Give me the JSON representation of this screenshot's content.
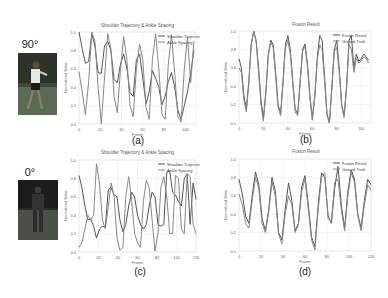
{
  "views": [
    {
      "angle_label": "90°",
      "photo": "person-walking-side-view"
    },
    {
      "angle_label": "0°",
      "photo": "person-walking-front-view"
    }
  ],
  "colors": {
    "series_a": "#555555",
    "series_b": "#888888",
    "grid": "#e6e6e6",
    "axis_text": "#666666"
  },
  "chart_data": [
    {
      "id": "a",
      "caption": "(a)",
      "type": "line",
      "title": "Shoulder Trajectory & Ankle Spacing",
      "xlabel": "Frame",
      "ylabel": "Normalized Data",
      "xlim": [
        0,
        110
      ],
      "ylim": [
        0,
        1.0
      ],
      "xticks": [
        0,
        20,
        40,
        60,
        80,
        100
      ],
      "yticks": [
        0.0,
        0.2,
        0.4,
        0.6,
        0.8,
        1.0
      ],
      "grid": true,
      "legend_position": "upper right",
      "x": [
        0,
        3,
        6,
        9,
        12,
        15,
        18,
        21,
        24,
        27,
        30,
        33,
        36,
        39,
        42,
        45,
        48,
        51,
        54,
        57,
        60,
        63,
        66,
        69,
        72,
        75,
        78,
        81,
        84,
        87,
        90,
        93,
        96,
        99,
        102,
        105,
        108
      ],
      "series": [
        {
          "name": "Shoulder Trajectory",
          "values": [
            1.0,
            0.82,
            0.66,
            0.68,
            0.98,
            0.84,
            0.56,
            0.55,
            0.85,
            0.9,
            0.8,
            0.48,
            0.45,
            0.65,
            0.76,
            0.6,
            0.34,
            0.3,
            0.7,
            0.76,
            0.5,
            0.22,
            0.35,
            0.58,
            0.5,
            0.4,
            0.21,
            0.3,
            0.46,
            0.56,
            0.4,
            0.15,
            0.05,
            0.2,
            0.35,
            0.55,
            0.8
          ]
        },
        {
          "name": "Ankle Spacing",
          "values": [
            0.57,
            0.35,
            0.1,
            0.45,
            1.0,
            0.9,
            0.4,
            0.0,
            0.5,
            0.98,
            0.82,
            0.3,
            0.12,
            0.6,
            0.95,
            0.7,
            0.2,
            0.08,
            0.6,
            0.87,
            0.7,
            0.18,
            0.05,
            0.7,
            0.98,
            0.6,
            0.1,
            0.05,
            0.65,
            0.97,
            0.55,
            0.08,
            0.02,
            0.6,
            0.95,
            0.45,
            0.9
          ]
        }
      ]
    },
    {
      "id": "b",
      "caption": "(b)",
      "type": "line",
      "title": "Fusion Result",
      "xlabel": "Frame",
      "ylabel": "Normalized Data",
      "xlim": [
        0,
        108
      ],
      "ylim": [
        0,
        1.0
      ],
      "xticks": [
        0,
        20,
        40,
        60,
        80,
        100
      ],
      "yticks": [
        0.0,
        0.2,
        0.4,
        0.6,
        0.8,
        1.0
      ],
      "grid": true,
      "legend_position": "upper right",
      "x": [
        0,
        2,
        4,
        6,
        8,
        10,
        12,
        14,
        16,
        18,
        20,
        22,
        24,
        26,
        28,
        30,
        32,
        34,
        36,
        38,
        40,
        42,
        44,
        46,
        48,
        50,
        52,
        54,
        56,
        58,
        60,
        62,
        64,
        66,
        68,
        70,
        72,
        74,
        76,
        78,
        80,
        82,
        84,
        86,
        88,
        90,
        92,
        94,
        96,
        98,
        100,
        102,
        104,
        106
      ],
      "series": [
        {
          "name": "Fusion Result",
          "values": [
            0.7,
            0.6,
            0.3,
            0.15,
            0.45,
            0.85,
            1.0,
            0.9,
            0.6,
            0.25,
            0.05,
            0.35,
            0.75,
            0.9,
            0.85,
            0.55,
            0.2,
            0.1,
            0.45,
            0.85,
            0.95,
            0.8,
            0.45,
            0.15,
            0.1,
            0.45,
            0.8,
            0.86,
            0.65,
            0.3,
            0.05,
            0.3,
            0.7,
            0.95,
            0.9,
            0.5,
            0.1,
            0.0,
            0.4,
            0.8,
            0.9,
            0.6,
            0.2,
            0.08,
            0.4,
            0.9,
            0.95,
            0.6,
            0.75,
            0.67,
            0.7,
            0.75,
            0.72,
            0.68
          ]
        },
        {
          "name": "Ground Truth",
          "values": [
            0.6,
            0.55,
            0.25,
            0.12,
            0.42,
            0.85,
            1.0,
            0.88,
            0.55,
            0.2,
            0.02,
            0.32,
            0.73,
            0.88,
            0.82,
            0.5,
            0.17,
            0.08,
            0.42,
            0.82,
            0.9,
            0.75,
            0.42,
            0.12,
            0.08,
            0.42,
            0.78,
            0.83,
            0.62,
            0.27,
            0.03,
            0.28,
            0.68,
            0.85,
            0.8,
            0.45,
            0.08,
            0.0,
            0.38,
            0.78,
            0.82,
            0.55,
            0.18,
            0.06,
            0.38,
            0.85,
            0.8,
            0.55,
            0.7,
            0.65,
            0.68,
            0.72,
            0.7,
            0.65
          ]
        }
      ]
    },
    {
      "id": "c",
      "caption": "(c)",
      "type": "line",
      "title": "Shoulder Trajectory & Ankle Spacing",
      "xlabel": "Frame",
      "ylabel": "Normalized Data",
      "xlim": [
        0,
        120
      ],
      "ylim": [
        0,
        1.0
      ],
      "xticks": [
        0,
        20,
        40,
        60,
        80,
        100,
        120
      ],
      "yticks": [
        0.0,
        0.2,
        0.4,
        0.6,
        0.8,
        1.0
      ],
      "grid": true,
      "legend_position": "upper right",
      "x": [
        0,
        3,
        6,
        9,
        12,
        15,
        18,
        21,
        24,
        27,
        30,
        33,
        36,
        39,
        42,
        45,
        48,
        51,
        54,
        57,
        60,
        63,
        66,
        69,
        72,
        75,
        78,
        81,
        84,
        87,
        90,
        93,
        96,
        99,
        102,
        105,
        108,
        111,
        114,
        117,
        120
      ],
      "series": [
        {
          "name": "Shoulder Trajectory",
          "values": [
            0.83,
            0.7,
            0.5,
            0.35,
            0.36,
            0.28,
            0.15,
            0.25,
            0.28,
            0.27,
            0.68,
            0.7,
            0.62,
            0.6,
            0.35,
            0.22,
            0.3,
            0.5,
            0.65,
            0.6,
            0.4,
            0.3,
            0.25,
            0.3,
            0.5,
            0.65,
            0.6,
            0.3,
            0.28,
            0.3,
            0.87,
            0.88,
            0.65,
            0.62,
            0.55,
            0.5,
            0.8,
            0.85,
            0.3,
            0.75,
            0.57
          ]
        },
        {
          "name": "Ankle Spacing",
          "values": [
            0.05,
            0.1,
            0.25,
            0.4,
            0.35,
            0.4,
            0.96,
            0.75,
            0.35,
            0.25,
            0.5,
            0.75,
            0.6,
            0.15,
            0.02,
            0.05,
            0.6,
            0.82,
            0.55,
            0.2,
            0.1,
            0.05,
            0.55,
            0.78,
            0.7,
            0.35,
            0.01,
            0.2,
            0.7,
            0.82,
            0.6,
            0.2,
            0.2,
            0.83,
            0.8,
            0.25,
            0.2,
            0.85,
            0.82,
            0.3,
            0.2
          ]
        }
      ]
    },
    {
      "id": "d",
      "caption": "(d)",
      "type": "line",
      "title": "Fusion Result",
      "xlabel": "Frame",
      "ylabel": "Normalized Data",
      "xlim": [
        0,
        120
      ],
      "ylim": [
        0,
        1.0
      ],
      "xticks": [
        0,
        20,
        40,
        60,
        80,
        100,
        120
      ],
      "yticks": [
        0.0,
        0.2,
        0.4,
        0.6,
        0.8,
        1.0
      ],
      "grid": true,
      "legend_position": "upper right",
      "x": [
        0,
        3,
        6,
        9,
        12,
        15,
        18,
        21,
        24,
        27,
        30,
        33,
        36,
        39,
        42,
        45,
        48,
        51,
        54,
        57,
        60,
        63,
        66,
        69,
        72,
        75,
        78,
        81,
        84,
        87,
        90,
        93,
        96,
        99,
        102,
        105,
        108,
        111,
        114,
        117,
        120
      ],
      "series": [
        {
          "name": "Fusion Result",
          "values": [
            0.78,
            0.62,
            0.38,
            0.3,
            0.6,
            0.86,
            0.72,
            0.35,
            0.22,
            0.45,
            0.8,
            0.65,
            0.2,
            0.12,
            0.45,
            0.74,
            0.55,
            0.22,
            0.3,
            0.7,
            0.82,
            0.5,
            0.15,
            0.05,
            0.5,
            0.85,
            0.8,
            0.38,
            0.3,
            0.68,
            0.92,
            0.5,
            0.25,
            0.65,
            0.88,
            0.78,
            0.4,
            0.25,
            0.55,
            0.78,
            0.72
          ]
        },
        {
          "name": "Ground Truth",
          "values": [
            0.62,
            0.5,
            0.3,
            0.25,
            0.55,
            0.8,
            0.68,
            0.3,
            0.2,
            0.42,
            0.75,
            0.6,
            0.18,
            0.08,
            0.4,
            0.6,
            0.5,
            0.2,
            0.28,
            0.65,
            0.78,
            0.45,
            0.12,
            0.01,
            0.45,
            0.8,
            0.85,
            0.35,
            0.32,
            0.75,
            0.78,
            0.45,
            0.22,
            0.6,
            0.85,
            0.75,
            0.38,
            0.22,
            0.5,
            0.72,
            0.66
          ]
        }
      ]
    }
  ]
}
